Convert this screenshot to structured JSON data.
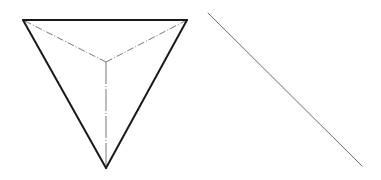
{
  "page": {
    "background_color": "#ffffff",
    "width": 381,
    "height": 180
  },
  "figures": {
    "tetrahedron": {
      "name": "tetrahedron",
      "description": "Tetrahedron shown as a downward pointing triangle with hidden interior edges",
      "stroke_color": "#1a1a1a",
      "hidden_stroke_color": "#7a7a7a",
      "solid_stroke_width": 2,
      "hidden_stroke_width": 1,
      "hidden_dash_pattern": "7 2 1 2",
      "vertices": {
        "top_left": {
          "label": "A",
          "x": 23,
          "y": 20
        },
        "top_right": {
          "label": "B",
          "x": 187,
          "y": 20
        },
        "bottom": {
          "label": "C",
          "x": 106,
          "y": 168
        },
        "interior": {
          "label": "D",
          "x": 106,
          "y": 62
        }
      },
      "solid_edges": [
        {
          "name": "top-edge",
          "from": "top_left",
          "to": "top_right"
        },
        {
          "name": "left-edge",
          "from": "top_left",
          "to": "bottom"
        },
        {
          "name": "right-edge",
          "from": "top_right",
          "to": "bottom"
        }
      ],
      "hidden_edges": [
        {
          "name": "hidden-edge-to-top-left",
          "from": "interior",
          "to": "top_left"
        },
        {
          "name": "hidden-edge-to-top-right",
          "from": "interior",
          "to": "top_right"
        },
        {
          "name": "hidden-edge-to-bottom",
          "from": "interior",
          "to": "bottom"
        }
      ]
    },
    "diagonal_line": {
      "name": "diagonal-line",
      "description": "Single thin straight line sloping down to the right",
      "stroke_color": "#6b6b6b",
      "stroke_width": 1,
      "start": {
        "x": 208,
        "y": 13
      },
      "end": {
        "x": 362,
        "y": 166
      }
    }
  }
}
